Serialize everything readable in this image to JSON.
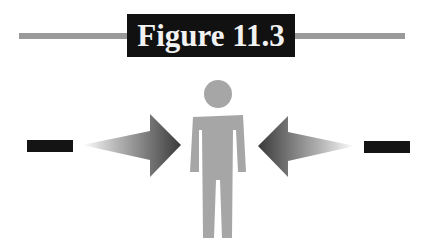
{
  "figure": {
    "title": "Figure 11.3",
    "colors": {
      "title_bg": "#111111",
      "title_text": "#f2f2f2",
      "rule": "#9a9a9a",
      "person": "#a6a6a6",
      "arrow_dark": "#3a3a3a",
      "dash": "#141414"
    },
    "elements": [
      {
        "type": "minus-sign",
        "side": "left"
      },
      {
        "type": "arrow",
        "direction": "right",
        "side": "left"
      },
      {
        "type": "person-figure",
        "position": "center"
      },
      {
        "type": "arrow",
        "direction": "left",
        "side": "right"
      },
      {
        "type": "minus-sign",
        "side": "right"
      }
    ]
  }
}
